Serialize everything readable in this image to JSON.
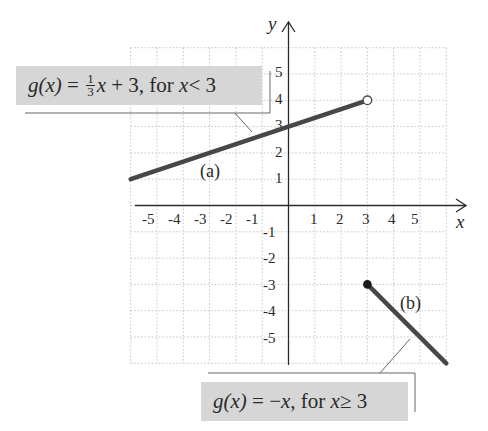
{
  "chart_data": {
    "type": "line",
    "title": "",
    "xlabel": "x",
    "ylabel": "y",
    "xlim": [
      -6,
      6
    ],
    "ylim": [
      -6,
      6
    ],
    "grid": true,
    "x_ticks": [
      "-5",
      "-4",
      "-3",
      "-2",
      "-1",
      "1",
      "2",
      "3",
      "4",
      "5"
    ],
    "y_ticks": [
      "5",
      "4",
      "3",
      "2",
      "1",
      "-1",
      "-2",
      "-3",
      "-4",
      "-5"
    ],
    "series": [
      {
        "name": "(a)",
        "equation": "g(x) = 1/3 x + 3, for x < 3",
        "x": [
          -6,
          3
        ],
        "y": [
          1,
          4
        ],
        "endpoints": [
          {
            "x": 3,
            "y": 4,
            "style": "open"
          }
        ]
      },
      {
        "name": "(b)",
        "equation": "g(x) = -x, for x ≥ 3",
        "x": [
          3,
          6
        ],
        "y": [
          -3,
          -6
        ],
        "endpoints": [
          {
            "x": 3,
            "y": -3,
            "style": "closed"
          }
        ]
      }
    ]
  },
  "labels": {
    "a": {
      "lhs": "g(x)",
      "eq": "=",
      "frac_num": "1",
      "frac_den": "3",
      "rest_var": "x",
      "rest": "+ 3, for",
      "cond_var": "x",
      "cond": "< 3",
      "part": "(a)"
    },
    "b": {
      "lhs": "g(x)",
      "eq": "=",
      "rest": "−",
      "rest_var": "x",
      "rest2": ", for",
      "cond_var": "x",
      "cond": "≥ 3",
      "part": "(b)"
    }
  },
  "axes": {
    "x_label": "x",
    "y_label": "y"
  },
  "colors": {
    "line": "#474747",
    "grid": "#b5b5b5",
    "label_bg": "#d6d6d6",
    "axis": "#2a2a2a"
  }
}
